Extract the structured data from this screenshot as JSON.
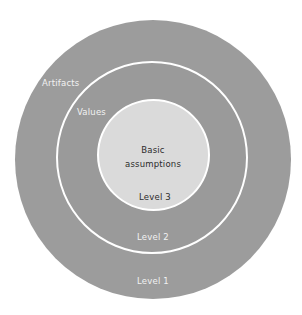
{
  "diagram": {
    "type": "concentric-circles",
    "colors": {
      "outer_ring": "#9c9c9c",
      "middle_ring": "#9a9a9a",
      "inner_circle": "#dadada",
      "separator": "#ffffff",
      "light_text": "#f2f2f2",
      "dark_text": "#2c2c2c"
    },
    "levels": [
      {
        "level": 1,
        "name": "Artifacts",
        "level_label": "Level 1"
      },
      {
        "level": 2,
        "name": "Values",
        "level_label": "Level 2"
      },
      {
        "level": 3,
        "name_line1": "Basic",
        "name_line2": "assumptions",
        "level_label": "Level 3"
      }
    ]
  }
}
